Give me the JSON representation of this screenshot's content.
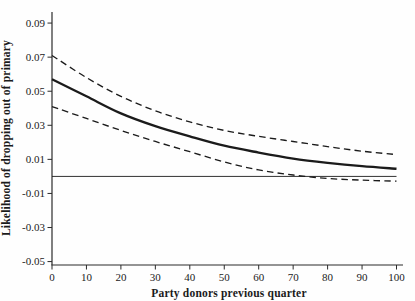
{
  "figure": {
    "background": "#fefefe",
    "ink_color": "#1b1b1b",
    "axis_color": "#2a2a2a"
  },
  "chart_data": {
    "type": "line",
    "title": "",
    "xlabel": "Party donors previous quarter",
    "ylabel": "Likelihood of dropping out of primary",
    "xlim": [
      0,
      100
    ],
    "ylim": [
      -0.052,
      0.0965
    ],
    "grid": false,
    "legend": "none",
    "reference_line_y": 0,
    "x": [
      0,
      10,
      20,
      30,
      40,
      50,
      60,
      70,
      80,
      90,
      100
    ],
    "series": [
      {
        "name": "estimate",
        "style": "solid",
        "stroke_width": 2.3,
        "values": [
          0.057,
          0.047,
          0.037,
          0.0295,
          0.0235,
          0.018,
          0.014,
          0.0105,
          0.008,
          0.006,
          0.0045
        ]
      },
      {
        "name": "upper-ci",
        "style": "dashed",
        "stroke_width": 1.35,
        "values": [
          0.071,
          0.058,
          0.047,
          0.0385,
          0.032,
          0.027,
          0.0235,
          0.0205,
          0.0175,
          0.0148,
          0.0128
        ]
      },
      {
        "name": "lower-ci",
        "style": "dashed",
        "stroke_width": 1.35,
        "values": [
          0.041,
          0.034,
          0.027,
          0.0205,
          0.0145,
          0.0085,
          0.0038,
          0.0008,
          -0.0012,
          -0.0022,
          -0.0028
        ]
      }
    ],
    "x_ticks": [
      0,
      10,
      20,
      30,
      40,
      50,
      60,
      70,
      80,
      90,
      100
    ],
    "x_tick_labels": [
      "0",
      "10",
      "20",
      "30",
      "40",
      "50",
      "60",
      "70",
      "80",
      "90",
      "100"
    ],
    "y_ticks": [
      0.09,
      0.07,
      0.05,
      0.03,
      0.01,
      -0.01,
      -0.03,
      -0.05
    ],
    "y_tick_labels": [
      "0.09",
      "0.07",
      "0.05",
      "0.03",
      "0.01",
      "-0.01",
      "-0.03",
      "-0.05"
    ]
  }
}
